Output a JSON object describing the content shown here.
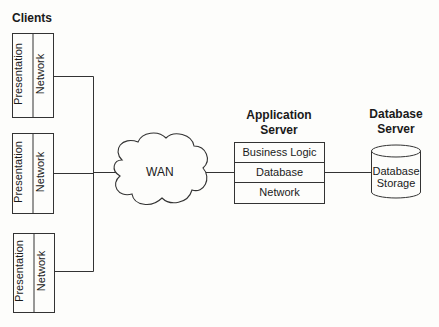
{
  "title": "Clients",
  "clients": [
    {
      "presentation": "Presentation",
      "network": "Network"
    },
    {
      "presentation": "Presentation",
      "network": "Network"
    },
    {
      "presentation": "Presentation",
      "network": "Network"
    }
  ],
  "wan": {
    "label": "WAN"
  },
  "app_server": {
    "title_line1": "Application",
    "title_line2": "Server",
    "layers": [
      "Business Logic",
      "Database",
      "Network"
    ]
  },
  "db_server": {
    "title_line1": "Database",
    "title_line2": "Server",
    "storage_line1": "Database",
    "storage_line2": "Storage"
  }
}
